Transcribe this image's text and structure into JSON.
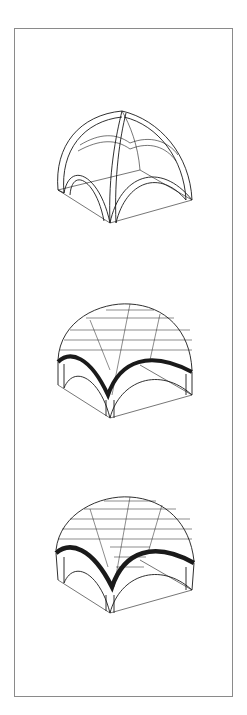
{
  "figure": {
    "stages": [
      {
        "name": "rib-skeleton",
        "label": ""
      },
      {
        "name": "infill-partial",
        "label": ""
      },
      {
        "name": "infill-complete",
        "label": ""
      }
    ]
  },
  "colors": {
    "line": "#1a1a1a",
    "frame": "#8a8a8a",
    "background": "#ffffff"
  }
}
